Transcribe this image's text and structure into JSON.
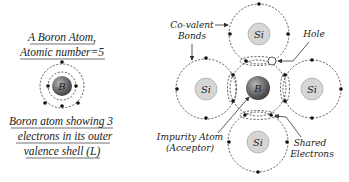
{
  "left_panel": {
    "title_line1": "A Boron Atom,",
    "title_line2": "Atomic number=5",
    "nucleus_label": "B",
    "caption_line1": "Boron atom showing 3",
    "caption_line2": "electrons in its outer",
    "caption_line3": "valence shell (L)"
  },
  "right_panel": {
    "center_atom_label": "B",
    "si_labels": [
      "Si",
      "Si",
      "Si",
      "Si"
    ],
    "labels": {
      "covalent_line1": "Co-valent",
      "covalent_line2": "Bonds",
      "hole": "Hole",
      "impurity_line1": "Impurity Atom",
      "impurity_line2": "(Acceptor)",
      "shared_line1": "Shared",
      "shared_line2": "Electrons"
    }
  },
  "colors": {
    "boron_nucleus": "#6e6e6e",
    "silicon_nucleus": "#d6d6d6",
    "line": "#333333"
  }
}
